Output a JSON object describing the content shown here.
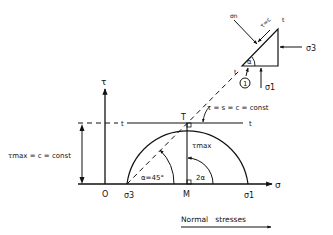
{
  "diagram": {
    "type": "mohr-circle",
    "axes": {
      "x_label": "σ",
      "y_label": "τ",
      "origin_label": "O"
    },
    "points": {
      "sigma3": "σ3",
      "sigma1": "σ1",
      "center": "M",
      "tangent_point": "T"
    },
    "labels": {
      "tau_max": "τmax",
      "tau_max_left": "τmax = c = const",
      "tangent_line": "τ = s = c = const",
      "angle_alpha": "α=45°",
      "angle_2alpha": "2α",
      "line_t_left": "t",
      "line_t_right": "t",
      "footer": "Normal   stresses"
    },
    "element": {
      "sigma_n": "σn",
      "tau_c": "τ=c",
      "t_top": "t",
      "t_bottom": "t",
      "alpha": "α",
      "sigma3": "σ3",
      "sigma1": "σ1",
      "plane_number": "1"
    }
  }
}
